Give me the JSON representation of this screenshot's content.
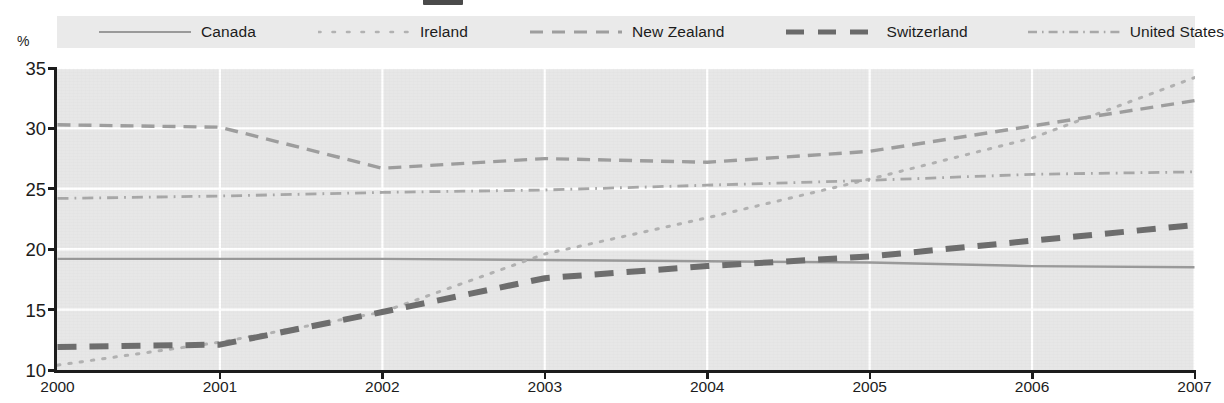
{
  "chart_data": {
    "type": "line",
    "title": "",
    "xlabel": "",
    "ylabel": "%",
    "ylim": [
      10,
      35
    ],
    "yticks": [
      10,
      15,
      20,
      25,
      30,
      35
    ],
    "xlim": [
      2000,
      2007
    ],
    "x": [
      2000,
      2001,
      2002,
      2003,
      2004,
      2005,
      2006,
      2007
    ],
    "categories": [
      "2000",
      "2001",
      "2002",
      "2003",
      "2004",
      "2005",
      "2006",
      "2007"
    ],
    "grid": true,
    "legend_position": "top",
    "series": [
      {
        "name": "Canada",
        "style": "solid",
        "color": "#9a9a9a",
        "values": [
          19.2,
          19.2,
          19.2,
          19.1,
          19.0,
          18.9,
          18.6,
          18.5
        ]
      },
      {
        "name": "Ireland",
        "style": "fine-dotted",
        "color": "#b2b2b2",
        "values": [
          10.4,
          12.3,
          14.8,
          19.6,
          22.6,
          25.8,
          29.2,
          34.2
        ]
      },
      {
        "name": "New Zealand",
        "style": "dashed-light",
        "color": "#9e9e9e",
        "values": [
          30.3,
          30.1,
          26.7,
          27.5,
          27.2,
          28.1,
          30.2,
          32.3
        ]
      },
      {
        "name": "Switzerland",
        "style": "heavy-dashed",
        "color": "#6e6e6e",
        "values": [
          11.9,
          12.1,
          14.8,
          17.6,
          18.6,
          19.4,
          20.7,
          22.0
        ]
      },
      {
        "name": "United States",
        "style": "dash-dot-fine",
        "color": "#a8a8a8",
        "values": [
          24.2,
          24.4,
          24.7,
          24.9,
          25.3,
          25.7,
          26.2,
          26.4
        ]
      }
    ]
  },
  "axis": {
    "unit_label": "%",
    "y_ticks": [
      "35",
      "30",
      "25",
      "20",
      "15",
      "10"
    ],
    "x_ticks": [
      "2000",
      "2001",
      "2002",
      "2003",
      "2004",
      "2005",
      "2006",
      "2007"
    ]
  },
  "legend": {
    "items": [
      {
        "label": "Canada",
        "style": "solid"
      },
      {
        "label": "Ireland",
        "style": "fine-dotted"
      },
      {
        "label": "New Zealand",
        "style": "dashed-light"
      },
      {
        "label": "Switzerland",
        "style": "heavy-dashed"
      },
      {
        "label": "United States",
        "style": "dash-dot-fine"
      }
    ]
  },
  "colors": {
    "plot_background": "#e7e7e7",
    "legend_background": "#eaeaea",
    "gridline": "#ffffff",
    "axis": "#1c1c1c"
  }
}
